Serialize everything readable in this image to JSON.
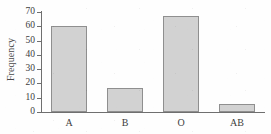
{
  "chart_data": {
    "type": "bar",
    "title": "",
    "subtitle": "",
    "xlabel": "",
    "ylabel": "Frequency",
    "categories": [
      "A",
      "B",
      "O",
      "AB"
    ],
    "values": [
      60,
      17,
      67,
      5.5
    ],
    "series": [
      {
        "name": "Frequency",
        "values": [
          60,
          17,
          67,
          5.5
        ]
      }
    ],
    "ylim": [
      0,
      70
    ],
    "y_ticks": [
      0,
      10,
      20,
      30,
      40,
      50,
      60,
      70
    ],
    "y_tick_labels": [
      "0",
      "10",
      "20",
      "30",
      "40",
      "50",
      "60",
      "70"
    ],
    "grid": false,
    "legend": false,
    "legend_position": "none",
    "annotations": [],
    "colors": {
      "bar_fill": "#d2d2d2",
      "bar_border": "#8f8f8f",
      "axis": "#6f6f6f",
      "text": "#3d3d3d",
      "background": "#fefefe"
    }
  }
}
